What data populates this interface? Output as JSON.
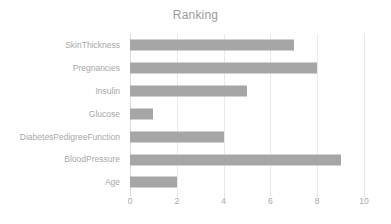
{
  "chart_data": {
    "type": "bar",
    "orientation": "horizontal",
    "title": "Ranking",
    "xlabel": "",
    "ylabel": "",
    "categories": [
      "SkinThickness",
      "Pregnancies",
      "Insulin",
      "Glucose",
      "DiabetesPedigreeFunction",
      "BloodPressure",
      "Age"
    ],
    "values": [
      7,
      8,
      5,
      1,
      4,
      9,
      2
    ],
    "xlim": [
      0,
      10
    ],
    "xticks": [
      0,
      2,
      4,
      6,
      8,
      10
    ],
    "xtick_labels": [
      "0",
      "2",
      "4",
      "6",
      "8",
      "10"
    ],
    "grid": true,
    "grid_axis": "x",
    "legend": false,
    "bar_color": "#a6a6a6",
    "text_color": "#a8a8a8",
    "gridline_color": "#e9e9e9",
    "background_color": "#ffffff"
  }
}
